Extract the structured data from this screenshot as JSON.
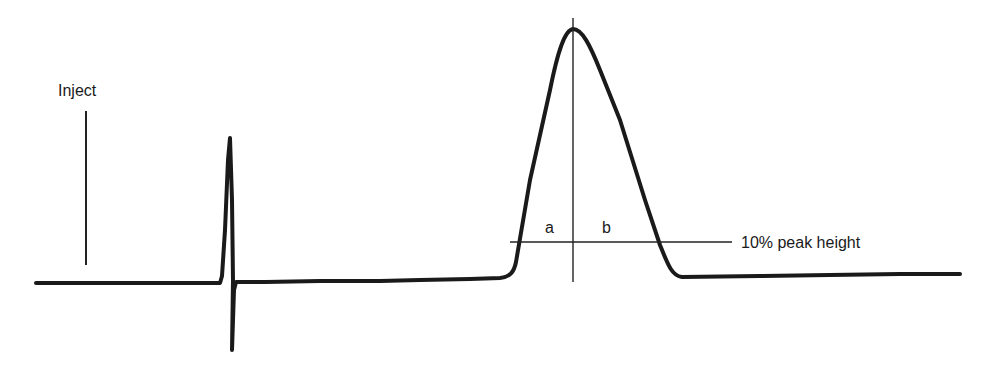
{
  "diagram": {
    "type": "chromatogram-peak-asymmetry",
    "labels": {
      "inject": "Inject",
      "a": "a",
      "b": "b",
      "peak_height_ref": "10% peak height"
    },
    "reference_fraction_of_peak_height": 0.1,
    "components": [
      {
        "id": "inject-marker",
        "description": "vertical injection marker"
      },
      {
        "id": "solvent-spike",
        "description": "sharp up/down spike shortly after injection"
      },
      {
        "id": "analyte-peak",
        "description": "tailing chromatographic peak"
      },
      {
        "id": "peak-center-line",
        "description": "vertical line through peak apex"
      },
      {
        "id": "ten-percent-line",
        "description": "horizontal line at 10% of peak height"
      }
    ],
    "colors": {
      "ink": "#1a1a1a",
      "background": "#ffffff"
    }
  }
}
